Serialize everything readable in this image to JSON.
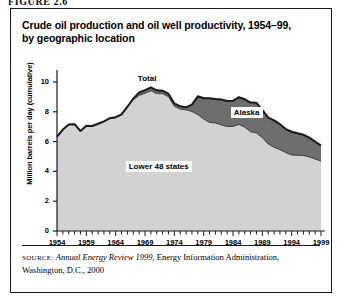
{
  "figure": {
    "label": "FIGURE 2.6"
  },
  "title": {
    "line1": "Crude oil production and oil well productivity, 1954–99,",
    "line2": "by geographic location"
  },
  "source": {
    "prefix": "SOURCE:",
    "italic": "Annual Energy Review 1999",
    "rest": ", Energy Information Administration, Washington, D.C., 2000"
  },
  "annotations": {
    "total": "Total",
    "alaska": "Alaska",
    "lower48": "Lower 48 states"
  },
  "colors": {
    "lower48_fill": "#d2d2d2",
    "alaska_fill": "#6e6e6e",
    "total_line": "#1a1a1a",
    "axis": "#1a1a1a",
    "panel_border": "#1a1a1a",
    "background": "#ffffff"
  },
  "chart_data": {
    "type": "area",
    "title": "Crude oil production and oil well productivity, 1954–99, by geographic location",
    "xlabel": "",
    "ylabel": "Million barrels per day (cumulative)",
    "stacked": true,
    "grid": false,
    "legend": "inline-labels",
    "xlim": [
      1954,
      1999
    ],
    "ylim": [
      0,
      10
    ],
    "yticks": [
      0,
      2,
      4,
      6,
      8,
      10
    ],
    "xticks": [
      1954,
      1959,
      1964,
      1969,
      1974,
      1979,
      1984,
      1989,
      1994,
      1999
    ],
    "xtick_labels": [
      "1954",
      "1959",
      "1964",
      "1969",
      "1974",
      "1979",
      "1984",
      "1989",
      "1994",
      "1999"
    ],
    "ytick_labels": [
      "0",
      "2",
      "4",
      "6",
      "8",
      "10"
    ],
    "x": [
      1954,
      1955,
      1956,
      1957,
      1958,
      1959,
      1960,
      1961,
      1962,
      1963,
      1964,
      1965,
      1966,
      1967,
      1968,
      1969,
      1970,
      1971,
      1972,
      1973,
      1974,
      1975,
      1976,
      1977,
      1978,
      1979,
      1980,
      1981,
      1982,
      1983,
      1984,
      1985,
      1986,
      1987,
      1988,
      1989,
      1990,
      1991,
      1992,
      1993,
      1994,
      1995,
      1996,
      1997,
      1998,
      1999
    ],
    "series": [
      {
        "name": "Lower 48 states",
        "values": [
          6.34,
          6.81,
          7.15,
          7.17,
          6.71,
          7.05,
          7.04,
          7.18,
          7.33,
          7.54,
          7.61,
          7.8,
          8.3,
          8.81,
          9.1,
          9.24,
          9.41,
          9.22,
          9.22,
          9.01,
          8.37,
          8.18,
          8.13,
          8.02,
          7.81,
          7.51,
          7.29,
          7.25,
          7.12,
          7.01,
          7.02,
          7.15,
          6.97,
          6.66,
          6.58,
          6.26,
          5.84,
          5.62,
          5.46,
          5.26,
          5.1,
          5.08,
          5.07,
          4.97,
          4.83,
          4.69
        ]
      },
      {
        "name": "Alaska",
        "values": [
          0.0,
          0.0,
          0.0,
          0.0,
          0.0,
          0.01,
          0.01,
          0.02,
          0.03,
          0.03,
          0.03,
          0.03,
          0.04,
          0.07,
          0.2,
          0.21,
          0.23,
          0.22,
          0.2,
          0.2,
          0.19,
          0.19,
          0.17,
          0.46,
          1.23,
          1.4,
          1.62,
          1.61,
          1.7,
          1.71,
          1.72,
          1.83,
          1.87,
          1.96,
          2.02,
          1.87,
          1.77,
          1.8,
          1.71,
          1.58,
          1.56,
          1.48,
          1.39,
          1.3,
          1.17,
          1.05
        ]
      }
    ],
    "total": {
      "name": "Total",
      "values": [
        6.34,
        6.81,
        7.15,
        7.17,
        6.71,
        7.06,
        7.05,
        7.2,
        7.36,
        7.57,
        7.64,
        7.83,
        8.34,
        8.88,
        9.3,
        9.45,
        9.64,
        9.44,
        9.42,
        9.21,
        8.56,
        8.37,
        8.3,
        8.48,
        9.04,
        8.91,
        8.91,
        8.86,
        8.82,
        8.72,
        8.74,
        8.98,
        8.84,
        8.62,
        8.6,
        8.13,
        7.61,
        7.42,
        7.17,
        6.84,
        6.66,
        6.56,
        6.46,
        6.27,
        6.0,
        5.74
      ]
    }
  }
}
